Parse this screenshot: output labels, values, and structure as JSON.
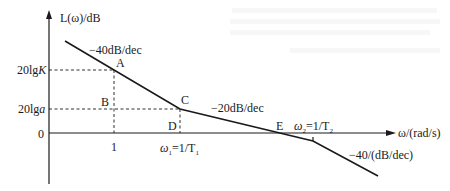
{
  "diagram": {
    "type": "bode-magnitude-asymptotic-plot",
    "y_axis_label": "L(ω)/dB",
    "x_axis_label": "ω/(rad/s)",
    "origin_label": "0",
    "y_ticks": [
      {
        "label": "20lgK",
        "label_plain": "20lg",
        "label_italic": "K"
      },
      {
        "label": "20lga",
        "label_plain": "20lg",
        "label_italic": "a"
      }
    ],
    "x_ticks": [
      {
        "label": "1"
      },
      {
        "label": "ω1=1/T1",
        "omega": "ω",
        "sub1": "1",
        "rest": "=1/T",
        "sub2": "1"
      }
    ],
    "points": {
      "A": "A",
      "B": "B",
      "C": "C",
      "D": "D",
      "E": "E"
    },
    "omega2_label": {
      "omega": "ω",
      "sub1": "2",
      "rest": "=1/T",
      "sub2": "2"
    },
    "slopes": {
      "segment1": "−40dB/dec",
      "segment2": "−20dB/dec",
      "segment3": "−40/(dB/dec)"
    },
    "colors": {
      "ink": "#1a1a1a",
      "background": "#ffffff"
    }
  }
}
